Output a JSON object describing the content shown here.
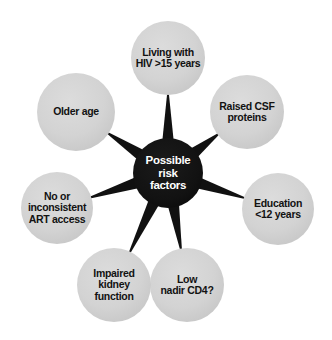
{
  "figure": {
    "type": "radial-hub-and-spoke-diagram",
    "title": "Possible risk factors",
    "background_color": "#ffffff",
    "node_count": 8
  },
  "hub": {
    "label": "Possible\nrisk\nfactors",
    "label_line1": "Possible",
    "label_line2": "risk",
    "label_line3": "factors",
    "fill_color": "#111111",
    "text_color": "#ffffff",
    "center_x": 168,
    "center_y": 173,
    "radius": 35
  },
  "spokes": {
    "fill_color": "#111111",
    "count": 7,
    "shape": "tapered-triangle"
  },
  "satellites": [
    {
      "id": "living-with-hiv",
      "label": "Living with\nHIV >15 years",
      "label_line1": "Living with",
      "label_line2": "HIV >15 years",
      "center_x": 168,
      "center_y": 58,
      "radius": 37,
      "angle_deg": 270,
      "fill_color": "#d2d2d2",
      "text_color": "#121212"
    },
    {
      "id": "raised-csf-proteins",
      "label": "Raised CSF\nproteins",
      "label_line1": "Raised CSF",
      "label_line2": "proteins",
      "center_x": 247,
      "center_y": 112,
      "radius": 37,
      "angle_deg": 325,
      "fill_color": "#d2d2d2",
      "text_color": "#121212"
    },
    {
      "id": "education-under-12-years",
      "label": "Education\n<12 years",
      "label_line1": "Education",
      "label_line2": "<12 years",
      "center_x": 278,
      "center_y": 209,
      "radius": 36,
      "angle_deg": 19,
      "fill_color": "#d2d2d2",
      "text_color": "#121212"
    },
    {
      "id": "low-nadir-cd4",
      "label": "Low\nnadir CD4?",
      "label_line1": "Low",
      "label_line2": "nadir CD4?",
      "center_x": 187,
      "center_y": 285,
      "radius": 37,
      "angle_deg": 75,
      "fill_color": "#d2d2d2",
      "text_color": "#121212"
    },
    {
      "id": "impaired-kidney-function",
      "label": "Impaired\nkidney\nfunction",
      "label_line1": "Impaired",
      "label_line2": "kidney",
      "label_line3": "function",
      "center_x": 114,
      "center_y": 285,
      "radius": 37,
      "angle_deg": 105,
      "fill_color": "#d2d2d2",
      "text_color": "#121212"
    },
    {
      "id": "no-or-inconsistent-art-access",
      "label": "No or\ninconsistent\nART access",
      "label_line1": "No or",
      "label_line2": "inconsistent",
      "label_line3": "ART access",
      "center_x": 57,
      "center_y": 208,
      "radius": 36,
      "angle_deg": 162,
      "fill_color": "#d2d2d2",
      "text_color": "#121212"
    },
    {
      "id": "older-age",
      "label": "Older age",
      "label_line1": "Older age",
      "center_x": 76,
      "center_y": 112,
      "radius": 39,
      "angle_deg": 215,
      "fill_color": "#d2d2d2",
      "text_color": "#121212"
    }
  ]
}
